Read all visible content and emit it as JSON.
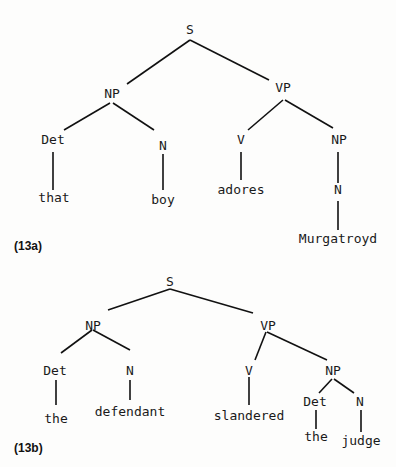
{
  "trees": [
    {
      "label": "(13a)",
      "nodes": [
        {
          "id": "S",
          "text": "S"
        },
        {
          "id": "NP1",
          "text": "NP"
        },
        {
          "id": "VP",
          "text": "VP"
        },
        {
          "id": "Det1",
          "text": "Det"
        },
        {
          "id": "N1",
          "text": "N"
        },
        {
          "id": "that",
          "text": "that"
        },
        {
          "id": "boy",
          "text": "boy"
        },
        {
          "id": "V",
          "text": "V"
        },
        {
          "id": "NP2",
          "text": "NP"
        },
        {
          "id": "adores",
          "text": "adores"
        },
        {
          "id": "N2",
          "text": "N"
        },
        {
          "id": "Murgatroyd",
          "text": "Murgatroyd"
        }
      ],
      "edges": [
        [
          "S",
          "NP1"
        ],
        [
          "S",
          "VP"
        ],
        [
          "NP1",
          "Det1"
        ],
        [
          "NP1",
          "N1"
        ],
        [
          "Det1",
          "that"
        ],
        [
          "N1",
          "boy"
        ],
        [
          "VP",
          "V"
        ],
        [
          "VP",
          "NP2"
        ],
        [
          "V",
          "adores"
        ],
        [
          "NP2",
          "N2"
        ],
        [
          "N2",
          "Murgatroyd"
        ]
      ]
    },
    {
      "label": "(13b)",
      "nodes": [
        {
          "id": "S",
          "text": "S"
        },
        {
          "id": "NP1",
          "text": "NP"
        },
        {
          "id": "VP",
          "text": "VP"
        },
        {
          "id": "Det1",
          "text": "Det"
        },
        {
          "id": "N1",
          "text": "N"
        },
        {
          "id": "the1",
          "text": "the"
        },
        {
          "id": "defendant",
          "text": "defendant"
        },
        {
          "id": "V",
          "text": "V"
        },
        {
          "id": "NP2",
          "text": "NP"
        },
        {
          "id": "slandered",
          "text": "slandered"
        },
        {
          "id": "Det2",
          "text": "Det"
        },
        {
          "id": "N2",
          "text": "N"
        },
        {
          "id": "the2",
          "text": "the"
        },
        {
          "id": "judge",
          "text": "judge"
        }
      ],
      "edges": [
        [
          "S",
          "NP1"
        ],
        [
          "S",
          "VP"
        ],
        [
          "NP1",
          "Det1"
        ],
        [
          "NP1",
          "N1"
        ],
        [
          "Det1",
          "the1"
        ],
        [
          "N1",
          "defendant"
        ],
        [
          "VP",
          "V"
        ],
        [
          "VP",
          "NP2"
        ],
        [
          "V",
          "slandered"
        ],
        [
          "NP2",
          "Det2"
        ],
        [
          "NP2",
          "N2"
        ],
        [
          "Det2",
          "the2"
        ],
        [
          "N2",
          "judge"
        ]
      ]
    }
  ]
}
